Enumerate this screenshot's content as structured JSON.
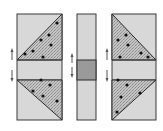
{
  "figure": {
    "colors": {
      "background": "#ffffff",
      "panel_fill": "#d6d6d6",
      "band_fill": "#dadada",
      "middle_band_fill": "#9a9a9a",
      "stipple_fill": "#bdbdbd",
      "outline": "#3a3a3a",
      "dot": "#111111",
      "arrow": "#555555"
    },
    "panels": [
      {
        "name": "left",
        "x": 17,
        "y": 14,
        "w": 45,
        "h": 106
      },
      {
        "name": "middle",
        "x": 77,
        "y": 14,
        "w": 19,
        "h": 106
      },
      {
        "name": "right",
        "x": 112,
        "y": 14,
        "w": 44,
        "h": 106
      }
    ],
    "band": {
      "y": 60,
      "h": 20
    },
    "arrows": [
      {
        "x": 12,
        "y1": 50,
        "y2": 60,
        "dir": "up"
      },
      {
        "x": 12,
        "y1": 70,
        "y2": 82,
        "dir": "down"
      },
      {
        "x": 72,
        "y1": 55,
        "y2": 63,
        "dir": "up"
      },
      {
        "x": 72,
        "y1": 67,
        "y2": 77,
        "dir": "down"
      },
      {
        "x": 107,
        "y1": 50,
        "y2": 60,
        "dir": "up"
      },
      {
        "x": 107,
        "y1": 70,
        "y2": 82,
        "dir": "down"
      }
    ]
  }
}
